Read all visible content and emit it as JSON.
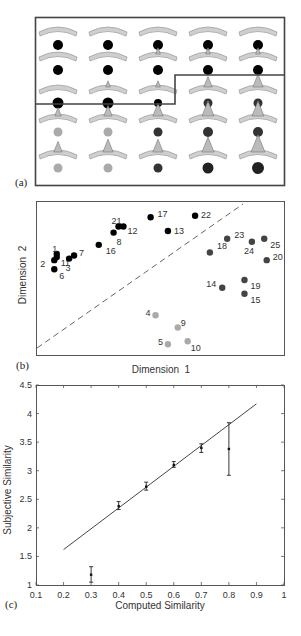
{
  "panels": {
    "a": {
      "label": "(a)",
      "grid_rows": 5,
      "grid_cols": 5,
      "cells": [
        {
          "row": 0,
          "col": 0,
          "spike": 0,
          "dot": "#000000",
          "dot_r": 5
        },
        {
          "row": 0,
          "col": 1,
          "spike": 0,
          "dot": "#000000",
          "dot_r": 5
        },
        {
          "row": 0,
          "col": 2,
          "spike": 0,
          "dot": "#000000",
          "dot_r": 5
        },
        {
          "row": 0,
          "col": 3,
          "spike": 0,
          "dot": "#000000",
          "dot_r": 5
        },
        {
          "row": 0,
          "col": 4,
          "spike": 0,
          "dot": "#000000",
          "dot_r": 5
        },
        {
          "row": 1,
          "col": 0,
          "spike": 0,
          "dot": "#000000",
          "dot_r": 5
        },
        {
          "row": 1,
          "col": 1,
          "spike": 0,
          "dot": "#000000",
          "dot_r": 5
        },
        {
          "row": 1,
          "col": 2,
          "spike": 1,
          "dot": "#000000",
          "dot_r": 5
        },
        {
          "row": 1,
          "col": 3,
          "spike": 1,
          "dot": "#000000",
          "dot_r": 5
        },
        {
          "row": 1,
          "col": 4,
          "spike": 1,
          "dot": "#000000",
          "dot_r": 5
        },
        {
          "row": 2,
          "col": 0,
          "spike": 0,
          "dot": "#000000",
          "dot_r": 5.5
        },
        {
          "row": 2,
          "col": 1,
          "spike": 1,
          "dot": "#000000",
          "dot_r": 5.5
        },
        {
          "row": 2,
          "col": 2,
          "spike": 1,
          "dot": "#000000",
          "dot_r": 4
        },
        {
          "row": 2,
          "col": 3,
          "spike": 3,
          "dot": "#333333",
          "dot_r": 4.5
        },
        {
          "row": 2,
          "col": 4,
          "spike": 4,
          "dot": "#333333",
          "dot_r": 4.5
        },
        {
          "row": 3,
          "col": 0,
          "spike": 2,
          "dot": "#aaaaaa",
          "dot_r": 4.5
        },
        {
          "row": 3,
          "col": 1,
          "spike": 3,
          "dot": "#aaaaaa",
          "dot_r": 4.5
        },
        {
          "row": 3,
          "col": 2,
          "spike": 4,
          "dot": "#333333",
          "dot_r": 4.5
        },
        {
          "row": 3,
          "col": 3,
          "spike": 5,
          "dot": "#333333",
          "dot_r": 5
        },
        {
          "row": 3,
          "col": 4,
          "spike": 5,
          "dot": "#333333",
          "dot_r": 5
        },
        {
          "row": 4,
          "col": 0,
          "spike": 3,
          "dot": "#aaaaaa",
          "dot_r": 4.5
        },
        {
          "row": 4,
          "col": 1,
          "spike": 4,
          "dot": "#aaaaaa",
          "dot_r": 4.5
        },
        {
          "row": 4,
          "col": 2,
          "spike": 4,
          "dot": "#333333",
          "dot_r": 4.5
        },
        {
          "row": 4,
          "col": 3,
          "spike": 5,
          "dot": "#222222",
          "dot_r": 5.5
        },
        {
          "row": 4,
          "col": 4,
          "spike": 6,
          "dot": "#222222",
          "dot_r": 6
        }
      ]
    },
    "b": {
      "label": "(b)",
      "xlabel": "Dimension  1",
      "ylabel": "Dimension  2"
    },
    "c": {
      "label": "(c)",
      "xlabel": "Computed Similarity",
      "ylabel": "Subjective Similarity"
    }
  },
  "chart_data": [
    {
      "type": "scatter",
      "title": "(b) MDS solution",
      "xlabel": "Dimension 1",
      "ylabel": "Dimension 2",
      "grid": false,
      "xlim": [
        0,
        100
      ],
      "ylim": [
        0,
        100
      ],
      "divider_line": {
        "style": "dashed",
        "from": [
          0,
          2
        ],
        "to": [
          82,
          100
        ]
      },
      "series": [
        {
          "name": "cluster-black",
          "color": "#000000",
          "points": [
            {
              "id": "1",
              "x": 8,
              "y": 66
            },
            {
              "id": "2",
              "x": 7,
              "y": 62
            },
            {
              "id": "11",
              "x": 8,
              "y": 64
            },
            {
              "id": "3",
              "x": 13,
              "y": 63
            },
            {
              "id": "7",
              "x": 15,
              "y": 65
            },
            {
              "id": "6",
              "x": 7,
              "y": 56
            },
            {
              "id": "16",
              "x": 25,
              "y": 72
            },
            {
              "id": "8",
              "x": 31,
              "y": 80
            },
            {
              "id": "21",
              "x": 33,
              "y": 84
            },
            {
              "id": "12",
              "x": 35,
              "y": 84
            },
            {
              "id": "17",
              "x": 46,
              "y": 90
            },
            {
              "id": "13",
              "x": 53,
              "y": 81
            },
            {
              "id": "22",
              "x": 64,
              "y": 91
            }
          ]
        },
        {
          "name": "cluster-dark-gray",
          "color": "#444444",
          "points": [
            {
              "id": "18",
              "x": 70,
              "y": 67
            },
            {
              "id": "23",
              "x": 77,
              "y": 76
            },
            {
              "id": "24",
              "x": 87,
              "y": 74
            },
            {
              "id": "25",
              "x": 92,
              "y": 76
            },
            {
              "id": "20",
              "x": 93,
              "y": 62
            },
            {
              "id": "14",
              "x": 75,
              "y": 44
            },
            {
              "id": "19",
              "x": 84,
              "y": 49
            },
            {
              "id": "15",
              "x": 84,
              "y": 40
            }
          ]
        },
        {
          "name": "cluster-light-gray",
          "color": "#aaaaaa",
          "points": [
            {
              "id": "4",
              "x": 48,
              "y": 26
            },
            {
              "id": "9",
              "x": 57,
              "y": 18
            },
            {
              "id": "5",
              "x": 53,
              "y": 7
            },
            {
              "id": "10",
              "x": 61,
              "y": 9
            }
          ]
        }
      ]
    },
    {
      "type": "line",
      "title": "(c) Subjective vs computed similarity",
      "xlabel": "Computed Similarity",
      "ylabel": "Subjective Similarity",
      "xlim": [
        0.1,
        1.0
      ],
      "ylim": [
        1,
        4.5
      ],
      "xticks": [
        "0.1",
        "0.2",
        "0.3",
        "0.4",
        "0.5",
        "0.6",
        "0.7",
        "0.8",
        "0.9",
        "1"
      ],
      "yticks": [
        "1",
        "1.5",
        "2",
        "2.5",
        "3",
        "3.5",
        "4",
        "4.5"
      ],
      "grid": false,
      "fit_line": {
        "x": [
          0.2,
          0.9
        ],
        "y": [
          1.62,
          4.17
        ]
      },
      "errorbar_points": [
        {
          "x": 0.3,
          "y": 1.18,
          "low": 1.05,
          "high": 1.32
        },
        {
          "x": 0.4,
          "y": 2.38,
          "low": 2.32,
          "high": 2.46
        },
        {
          "x": 0.5,
          "y": 2.72,
          "low": 2.66,
          "high": 2.8
        },
        {
          "x": 0.6,
          "y": 3.1,
          "low": 3.06,
          "high": 3.16
        },
        {
          "x": 0.7,
          "y": 3.4,
          "low": 3.32,
          "high": 3.47
        },
        {
          "x": 0.8,
          "y": 3.38,
          "low": 2.92,
          "high": 3.84
        }
      ]
    }
  ]
}
